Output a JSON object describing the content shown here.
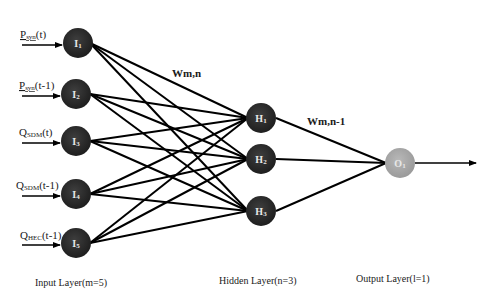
{
  "diagram": {
    "type": "neural-network",
    "colors": {
      "hidden_input_node": "#2b2b2b",
      "output_node": "#a9a9a9",
      "edge": "#000000",
      "node_text": "#e8e8e8"
    },
    "input_layer": {
      "label": "Input Layer(m=5)",
      "nodes": [
        {
          "id": "I1",
          "main": "I",
          "sub": "1",
          "input_var": "P",
          "input_sub": "syn",
          "input_arg": "(t)"
        },
        {
          "id": "I2",
          "main": "I",
          "sub": "2",
          "input_var": "P",
          "input_sub": "syn",
          "input_arg": "(t-1)"
        },
        {
          "id": "I3",
          "main": "I",
          "sub": "3",
          "input_var": "Q",
          "input_sub": "SDM",
          "input_arg": "(t)"
        },
        {
          "id": "I4",
          "main": "I",
          "sub": "4",
          "input_var": "Q",
          "input_sub": "SDM",
          "input_arg": "(t-1)"
        },
        {
          "id": "I5",
          "main": "I",
          "sub": "5",
          "input_var": "Q",
          "input_sub": "HEC",
          "input_arg": "(t-1)"
        }
      ]
    },
    "hidden_layer": {
      "label": "Hidden Layer(n=3)",
      "nodes": [
        {
          "id": "H1",
          "main": "H",
          "sub": "1"
        },
        {
          "id": "H2",
          "main": "H",
          "sub": "2"
        },
        {
          "id": "H3",
          "main": "H",
          "sub": "3"
        }
      ]
    },
    "output_layer": {
      "label": "Output Layer(l=1)",
      "nodes": [
        {
          "id": "O1",
          "main": "O",
          "sub": "1"
        }
      ]
    },
    "weights": {
      "input_hidden": "Wm,n",
      "hidden_output": "Wm,n-1"
    }
  }
}
